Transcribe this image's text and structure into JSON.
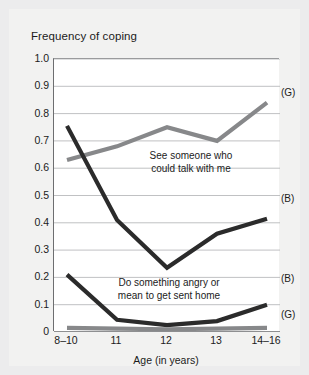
{
  "figure": {
    "title": "Frequency of coping",
    "background_color": "#ececed",
    "plot_background_color": "#ffffff"
  },
  "annotations": {
    "talk_line1": "See someone who",
    "talk_line2": "could talk with me",
    "angry_line1": "Do something angry or",
    "angry_line2": "mean to get sent home"
  },
  "series_tags": {
    "talk_girls": "(G)",
    "talk_boys": "(B)",
    "angry_boys": "(B)",
    "angry_girls": "(G)"
  },
  "chart_data": {
    "type": "line",
    "title": "Frequency of coping",
    "xlabel": "Age (in years)",
    "ylabel": "Frequency of coping",
    "categories": [
      "8–10",
      "11",
      "12",
      "13",
      "14–16"
    ],
    "ylim": [
      0,
      1.0
    ],
    "ytick_labels": [
      "1.0",
      "0.9",
      "0.8",
      "0.7",
      "0.6",
      "0.5",
      "0.4",
      "0.3",
      "0.2",
      "0.1",
      "0"
    ],
    "ytick_values": [
      1.0,
      0.9,
      0.8,
      0.7,
      0.6,
      0.5,
      0.4,
      0.3,
      0.2,
      0.1,
      0
    ],
    "grid": "horizontal",
    "legend": "inline-annotations",
    "series": [
      {
        "name": "See someone who could talk with me (G)",
        "group": "girls",
        "tag": "(G)",
        "color": "#87888a",
        "values": [
          0.63,
          0.68,
          0.75,
          0.7,
          0.84
        ]
      },
      {
        "name": "See someone who could talk with me (B)",
        "group": "boys",
        "tag": "(B)",
        "color": "#2b2b2b",
        "values": [
          0.755,
          0.41,
          0.235,
          0.36,
          0.415
        ]
      },
      {
        "name": "Do something angry or mean to get sent home (B)",
        "group": "boys",
        "tag": "(B)",
        "color": "#2b2b2b",
        "values": [
          0.21,
          0.045,
          0.025,
          0.04,
          0.1
        ]
      },
      {
        "name": "Do something angry or mean to get sent home (G)",
        "group": "girls",
        "tag": "(G)",
        "color": "#87888a",
        "values": [
          0.015,
          0.012,
          0.01,
          0.012,
          0.015
        ]
      }
    ]
  }
}
